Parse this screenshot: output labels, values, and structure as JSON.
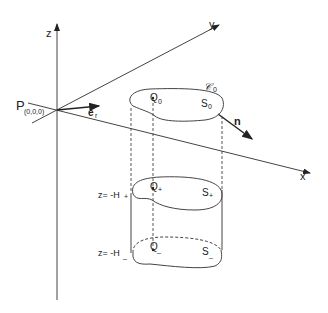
{
  "diagram": {
    "axes": {
      "z_label": "z",
      "y_label": "y",
      "x_label": "x",
      "origin_label": "P",
      "origin_coords": "(0,0,0)"
    },
    "vectors": {
      "radial_label": "e",
      "radial_sub": "r",
      "normal_label": "n"
    },
    "top_section": {
      "curve_label": "𝒞",
      "curve_sub": "0",
      "point_label": "Q",
      "point_sub": "0",
      "surface_label": "S",
      "surface_sub": "0"
    },
    "middle_section": {
      "level_label": "z= -H",
      "level_sub": "+",
      "point_label": "Q",
      "point_sub": "+",
      "surface_label": "S",
      "surface_sub": "+"
    },
    "bottom_section": {
      "level_label": "z= -H",
      "level_sub": "_",
      "point_label": "Q",
      "point_sub": "_",
      "surface_label": "S",
      "surface_sub": "_"
    }
  }
}
